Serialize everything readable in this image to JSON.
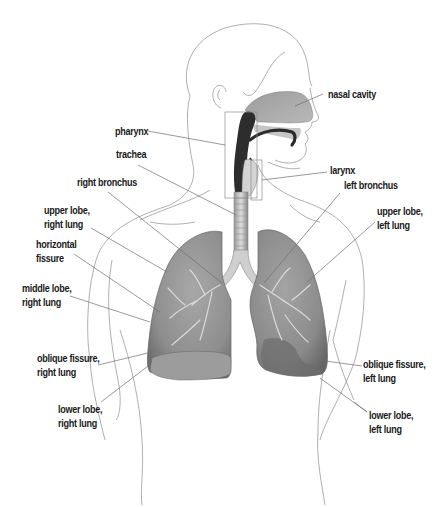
{
  "diagram": {
    "colors": {
      "outline": "#9a9a9a",
      "leader": "#6e6e6e",
      "lung_fill": "#8c8c8c",
      "lung_dark": "#5a5a5a",
      "airway_dark": "#2b2b2b",
      "nasal_fill": "#a9a9a9",
      "text": "#1a1a1a"
    },
    "labels": {
      "nasal_cavity": [
        "nasal cavity"
      ],
      "pharynx": [
        "pharynx"
      ],
      "trachea": [
        "trachea"
      ],
      "larynx": [
        "larynx"
      ],
      "right_bronchus": [
        "right bronchus"
      ],
      "left_bronchus": [
        "left bronchus"
      ],
      "upper_lobe_right": [
        "upper lobe,",
        "right lung"
      ],
      "upper_lobe_left": [
        "upper lobe,",
        "left lung"
      ],
      "horizontal_fissure": [
        "horizontal",
        "fissure"
      ],
      "middle_lobe_right": [
        "middle lobe,",
        "right lung"
      ],
      "oblique_fissure_right": [
        "oblique fissure,",
        "right lung"
      ],
      "oblique_fissure_left": [
        "oblique fissure,",
        "left lung"
      ],
      "lower_lobe_right": [
        "lower lobe,",
        "right lung"
      ],
      "lower_lobe_left": [
        "lower lobe,",
        "left lung"
      ]
    }
  }
}
